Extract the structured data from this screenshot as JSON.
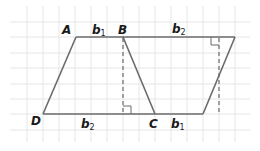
{
  "diagram": {
    "colors": {
      "grid": "#e6e6e6",
      "line": "#6b6b6b",
      "label": "#1a1a1a",
      "background": "#ffffff"
    },
    "vertices": {
      "A": {
        "label": "A"
      },
      "B": {
        "label": "B"
      },
      "C": {
        "label": "C"
      },
      "D": {
        "label": "D"
      }
    },
    "segment_labels": {
      "top_left": {
        "base": "b",
        "sub": "1"
      },
      "top_right": {
        "base": "b",
        "sub": "2"
      },
      "bottom_left": {
        "base": "b",
        "sub": "2"
      },
      "bottom_right": {
        "base": "b",
        "sub": "1"
      }
    },
    "heights": [
      "dashed height from B",
      "dashed height at right"
    ],
    "right_angle_markers": 2
  }
}
